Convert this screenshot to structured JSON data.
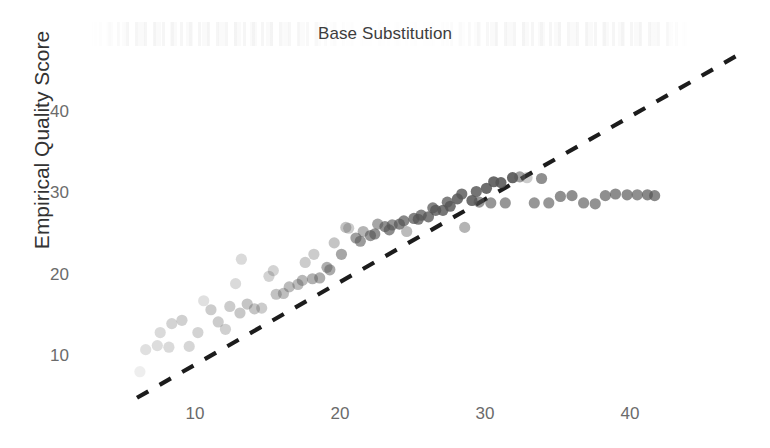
{
  "chart_data": {
    "type": "scatter",
    "title": "Base Substitution",
    "xlabel": "",
    "ylabel": "Empirical Quality Score",
    "xlim": [
      4,
      49
    ],
    "ylim": [
      4,
      48
    ],
    "xticks": [
      10,
      20,
      30,
      40
    ],
    "yticks": [
      10,
      20,
      30,
      40
    ],
    "grid": false,
    "legend": "none",
    "point_color": "#555555",
    "reference_line": {
      "name": "identity-line",
      "style": "dashed",
      "color": "#1c1c1c",
      "x": [
        6.0,
        47.3
      ],
      "y": [
        5.0,
        46.9
      ]
    },
    "series": [
      {
        "name": "Reported vs Empirical Quality",
        "x": [
          6.2,
          6.6,
          7.4,
          7.6,
          8.2,
          8.4,
          9.1,
          9.6,
          10.2,
          10.6,
          11.1,
          11.6,
          12.1,
          12.4,
          12.8,
          13.1,
          13.2,
          13.6,
          14.1,
          14.6,
          15.1,
          15.4,
          15.6,
          16.1,
          16.5,
          17.1,
          17.4,
          17.6,
          18.1,
          18.2,
          18.6,
          19.1,
          19.3,
          19.6,
          20.1,
          20.4,
          20.6,
          21.1,
          21.4,
          21.6,
          22.1,
          22.4,
          22.6,
          23.1,
          23.4,
          23.6,
          24.1,
          24.4,
          24.6,
          25.1,
          25.4,
          25.6,
          26.1,
          26.4,
          26.6,
          27.1,
          27.4,
          27.6,
          28.1,
          28.4,
          28.6,
          29.1,
          29.4,
          29.6,
          30.1,
          30.4,
          30.6,
          31.1,
          31.4,
          31.9,
          32.4,
          32.9,
          33.4,
          33.9,
          34.4,
          35.2,
          36.0,
          36.8,
          37.6,
          38.3,
          39.0,
          39.8,
          40.5,
          41.2,
          41.7
        ],
        "y": [
          8.2,
          10.9,
          11.4,
          13.0,
          11.2,
          14.1,
          14.5,
          11.3,
          13.0,
          16.9,
          15.8,
          14.3,
          13.4,
          16.2,
          19.0,
          15.4,
          22.0,
          16.5,
          15.9,
          16.0,
          19.9,
          20.6,
          17.7,
          17.8,
          18.6,
          18.9,
          19.4,
          21.6,
          19.6,
          22.6,
          19.7,
          21.0,
          20.7,
          24.0,
          22.6,
          25.9,
          25.8,
          24.6,
          24.2,
          25.4,
          24.9,
          25.1,
          26.3,
          26.0,
          25.6,
          26.2,
          26.3,
          26.7,
          25.4,
          27.0,
          26.9,
          27.4,
          27.2,
          28.3,
          28.0,
          28.0,
          29.0,
          28.5,
          29.4,
          30.0,
          25.9,
          29.2,
          30.3,
          29.0,
          30.7,
          28.9,
          31.5,
          31.4,
          28.9,
          32.0,
          32.1,
          32.0,
          28.9,
          31.9,
          28.9,
          29.7,
          29.8,
          28.9,
          28.8,
          29.8,
          30.0,
          29.9,
          29.9,
          29.9,
          29.8
        ],
        "alpha": [
          0.1,
          0.18,
          0.2,
          0.22,
          0.22,
          0.26,
          0.28,
          0.24,
          0.26,
          0.18,
          0.3,
          0.3,
          0.28,
          0.3,
          0.22,
          0.32,
          0.22,
          0.34,
          0.34,
          0.3,
          0.26,
          0.26,
          0.36,
          0.38,
          0.4,
          0.4,
          0.42,
          0.3,
          0.46,
          0.3,
          0.48,
          0.48,
          0.5,
          0.34,
          0.52,
          0.36,
          0.3,
          0.56,
          0.58,
          0.44,
          0.62,
          0.64,
          0.52,
          0.66,
          0.68,
          0.62,
          0.7,
          0.7,
          0.4,
          0.72,
          0.74,
          0.72,
          0.76,
          0.72,
          0.78,
          0.8,
          0.74,
          0.82,
          0.84,
          0.8,
          0.44,
          0.86,
          0.82,
          0.62,
          0.86,
          0.62,
          0.88,
          0.88,
          0.62,
          0.9,
          0.56,
          0.3,
          0.62,
          0.66,
          0.62,
          0.66,
          0.66,
          0.64,
          0.64,
          0.66,
          0.68,
          0.68,
          0.66
        ]
      }
    ]
  },
  "axis": {
    "y_ticks_text": [
      "40",
      "30",
      "20",
      "10"
    ],
    "x_ticks_text": [
      "10",
      "20",
      "30",
      "40"
    ]
  }
}
